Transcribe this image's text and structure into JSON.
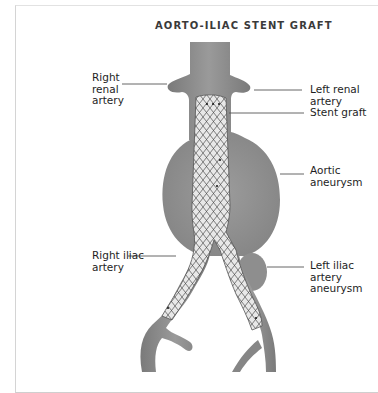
{
  "title": "AORTO-ILIAC STENT GRAFT",
  "labels": {
    "right_renal_artery": "Right\nrenal\nartery",
    "left_renal_artery": "Left renal\nartery",
    "stent_graft": "Stent graft",
    "aortic_aneurysm": "Aortic\naneurysm",
    "right_iliac_artery": "Right iliac\nartery",
    "left_iliac_artery_aneurysm": "Left iliac\nartery\naneurysm"
  },
  "colors": {
    "vessel": "#8a8a8a",
    "vessel_dark": "#6e6e6e",
    "aneurysm": "#939393",
    "stent_fill": "#e6e6e6",
    "stent_mesh": "#555555",
    "leader_line": "#555555",
    "text": "#1e1e1e"
  }
}
